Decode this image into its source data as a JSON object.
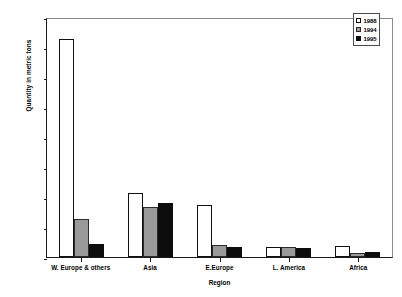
{
  "chart_data": {
    "type": "bar",
    "title": "",
    "xlabel": "Region",
    "ylabel": "Quantity in metric tons",
    "categories": [
      "W. Europe & others",
      "Asia",
      "E.Europe",
      "L. America",
      "Africa"
    ],
    "series": [
      {
        "name": "1988",
        "color": "#ffffff",
        "values": [
          727000,
          215000,
          175000,
          32000,
          36000
        ]
      },
      {
        "name": "1994",
        "color": "#9a9a9a",
        "values": [
          128000,
          168000,
          40000,
          32000,
          15000
        ]
      },
      {
        "name": "1995",
        "color": "#0d0d0d",
        "values": [
          44000,
          180000,
          34000,
          31000,
          18000
        ]
      }
    ],
    "ylim": [
      0,
      800000
    ],
    "ytick_values": [
      0,
      100000,
      200000,
      300000,
      400000,
      500000,
      600000,
      700000,
      800000
    ],
    "ytick_labels": [
      "0",
      "100000",
      "200000",
      "300000",
      "400000",
      "500000",
      "600000",
      "700000",
      "800000"
    ],
    "grid": false,
    "legend_position": "top-right"
  }
}
